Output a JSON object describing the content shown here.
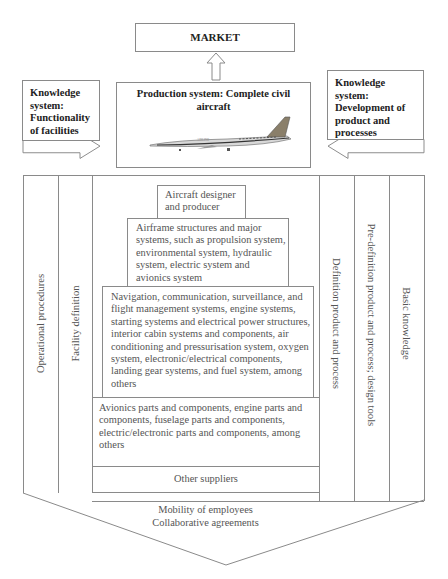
{
  "top": {
    "market_label": "MARKET",
    "production_title": "Production system: Complete civil aircraft",
    "aircraft_image": "civil-jet-airliner-illustration",
    "knowledge_left": "Knowledge system: Functionality of facilities",
    "knowledge_right": "Knowledge system: Development of product and processes"
  },
  "pyramid": {
    "level1": "Aircraft designer and producer",
    "level2": "Airframe structures and major systems, such as propulsion system, environmental system, hydraulic system, electric system and avionics system",
    "level3": "Navigation, communication, surveillance, and flight management systems, engine systems, starting systems and electrical power structures, interior cabin systems and components, air conditioning and pressurisation system, oxygen system, electronic/electrical components, landing gear systems, and fuel system, among others",
    "level4": "Avionics parts and components, engine parts and components, fuselage parts and components, electric/electronic parts and components, among others",
    "level5": "Other suppliers"
  },
  "columns": {
    "left_outer": "Operational procedures",
    "left_inner": "Facility definition",
    "right_inner": "Definition product and process",
    "right_middle": "Pre-definition product and process; design tools",
    "right_outer": "Basic knowledge"
  },
  "bottom": {
    "line1": "Mobility of employees",
    "line2": "Collaborative agreements"
  },
  "colors": {
    "line": "#8a8a8a",
    "text": "#555555",
    "bold_text": "#222222"
  }
}
